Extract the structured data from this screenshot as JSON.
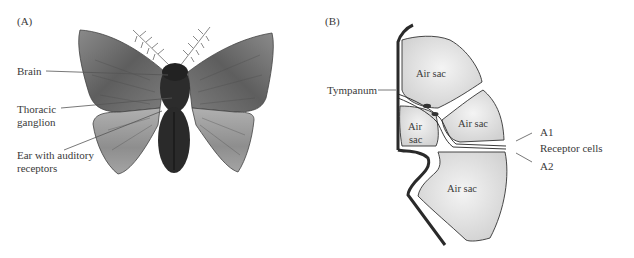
{
  "panel_a": {
    "tag": "(A)",
    "labels": {
      "brain": "Brain",
      "thoracic_1": "Thoracic",
      "thoracic_2": "ganglion",
      "ear_1": "Ear with auditory",
      "ear_2": "receptors"
    }
  },
  "panel_b": {
    "tag": "(B)",
    "labels": {
      "tympanum": "Tympanum",
      "a1": "A1",
      "receptor_cells": "Receptor cells",
      "a2": "A2"
    },
    "air_sacs": {
      "top": "Air sac",
      "middle_right": "Air sac",
      "small_left_1": "Air",
      "small_left_2": "sac",
      "bottom": "Air sac"
    }
  },
  "colors": {
    "wing_dark": "#6e6e6e",
    "wing_light": "#a8a8a8",
    "body": "#2a2a2a",
    "air_sac_fill": "#e4e4e4",
    "outline": "#333333"
  }
}
